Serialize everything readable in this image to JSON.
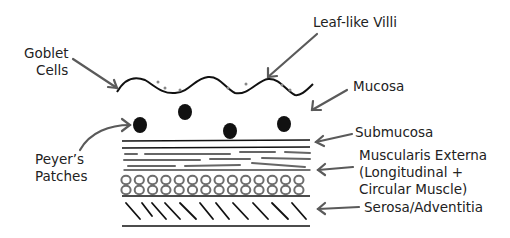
{
  "diagram": {
    "labels": {
      "goblet_cells_line1": "Goblet",
      "goblet_cells_line2": "Cells",
      "villi": "Leaf-like Villi",
      "mucosa": "Mucosa",
      "peyers_line1": "Peyer’s",
      "peyers_line2": "Patches",
      "submucosa": "Submucosa",
      "muscularis_line1": "Muscularis Externa",
      "muscularis_line2": "(Longitudinal +",
      "muscularis_line3": "Circular Muscle)",
      "serosa": "Serosa/Adventitia"
    },
    "colors": {
      "ink": "#111111",
      "arrow": "#5a5a5a",
      "muscle": "#6e6e6e"
    }
  }
}
